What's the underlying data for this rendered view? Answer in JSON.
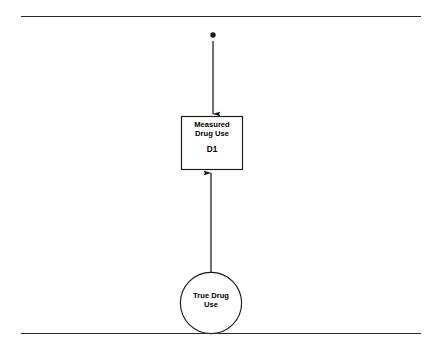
{
  "figure": {
    "background_color": "#ffffff",
    "stroke_color": "#2b2b2b",
    "text_color": "#000000"
  },
  "rules": {
    "top_label": "top-horizontal-rule",
    "bottom_label": "bottom-horizontal-rule"
  },
  "nodes": {
    "disturbance": {
      "label": "",
      "shape": "filled-dot"
    },
    "measured": {
      "line1": "Measured",
      "line2": "Drug Use",
      "id": "D1",
      "shape": "rectangle"
    },
    "latent": {
      "line1": "True Drug",
      "line2": "Use",
      "shape": "circle"
    }
  },
  "edges": [
    {
      "name": "disturbance-to-measured",
      "from": "disturbance",
      "to": "measured",
      "direction": "down",
      "label": ""
    },
    {
      "name": "latent-to-measured",
      "from": "latent",
      "to": "measured",
      "direction": "up",
      "label": ""
    }
  ]
}
